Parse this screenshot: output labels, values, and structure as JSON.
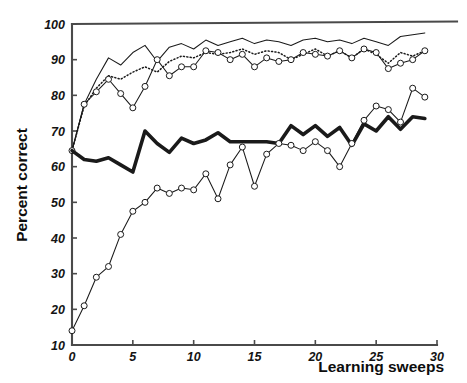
{
  "chart_data": {
    "type": "line",
    "title": "",
    "xlabel": "Learning sweeps",
    "ylabel": "Percent correct",
    "xlim": [
      0,
      30
    ],
    "ylim": [
      10,
      100
    ],
    "xticks": [
      0,
      5,
      10,
      15,
      20,
      25,
      30
    ],
    "xticklabels": [
      "0",
      "5",
      "10",
      "15",
      "20",
      "25",
      "30"
    ],
    "yticks": [
      10,
      20,
      30,
      40,
      50,
      60,
      70,
      80,
      90,
      100
    ],
    "yticklabels": [
      "10",
      "20",
      "30",
      "40",
      "50",
      "60",
      "70",
      "80",
      "90",
      "100"
    ],
    "grid": false,
    "legend": "none",
    "x": [
      0,
      1,
      2,
      3,
      4,
      5,
      6,
      7,
      8,
      9,
      10,
      11,
      12,
      13,
      14,
      15,
      16,
      17,
      18,
      19,
      20,
      21,
      22,
      23,
      24,
      25,
      26,
      27,
      28,
      29
    ],
    "series": [
      {
        "name": "upper-solid-thin",
        "style": "solid-thin",
        "markers": "none",
        "color": "#1a1a1a",
        "values": [
          64.5,
          77.5,
          84.5,
          90.5,
          88.5,
          92.0,
          94.0,
          89.5,
          93.5,
          94.5,
          93.0,
          95.5,
          94.0,
          95.0,
          96.0,
          94.5,
          95.5,
          95.0,
          94.0,
          95.5,
          96.0,
          95.0,
          95.5,
          94.5,
          96.0,
          95.0,
          94.0,
          96.5,
          97.0,
          97.5
        ]
      },
      {
        "name": "upper-dotted",
        "style": "dotted",
        "markers": "none",
        "color": "#1a1a1a",
        "values": [
          64.5,
          77.0,
          82.0,
          85.5,
          84.5,
          86.5,
          88.0,
          86.5,
          89.5,
          91.0,
          90.5,
          92.0,
          91.5,
          92.0,
          93.0,
          91.5,
          92.5,
          92.0,
          90.0,
          91.5,
          93.0,
          91.0,
          92.5,
          90.5,
          93.0,
          91.5,
          89.0,
          92.0,
          91.0,
          92.5
        ]
      },
      {
        "name": "upper-circles",
        "style": "solid-thin",
        "markers": "circle",
        "color": "#1a1a1a",
        "values": [
          64.5,
          77.5,
          81.0,
          84.5,
          80.5,
          76.5,
          82.5,
          90.0,
          85.5,
          88.0,
          88.0,
          92.5,
          92.0,
          90.0,
          91.5,
          88.0,
          90.5,
          89.5,
          90.0,
          92.0,
          91.5,
          91.0,
          92.5,
          90.5,
          93.0,
          92.0,
          87.5,
          89.0,
          90.0,
          92.5
        ]
      },
      {
        "name": "middle-thick",
        "style": "solid-thick",
        "markers": "none",
        "color": "#1a1a1a",
        "values": [
          64.5,
          62.0,
          61.5,
          62.5,
          60.5,
          58.5,
          70.0,
          66.5,
          64.0,
          68.0,
          66.5,
          67.5,
          69.5,
          67.0,
          67.0,
          67.0,
          67.0,
          66.5,
          71.5,
          69.0,
          71.5,
          68.5,
          71.0,
          66.0,
          72.0,
          70.0,
          74.0,
          70.5,
          74.0,
          73.5
        ]
      },
      {
        "name": "lower-circles",
        "style": "solid-thin",
        "markers": "circle",
        "color": "#1a1a1a",
        "values": [
          14.0,
          21.0,
          29.0,
          32.0,
          41.0,
          47.5,
          50.0,
          54.0,
          52.5,
          54.0,
          53.5,
          58.0,
          51.0,
          60.5,
          65.5,
          54.5,
          63.5,
          66.5,
          66.0,
          64.5,
          67.0,
          64.5,
          60.0,
          66.5,
          73.0,
          77.0,
          76.0,
          72.5,
          82.0,
          79.5
        ]
      }
    ]
  }
}
